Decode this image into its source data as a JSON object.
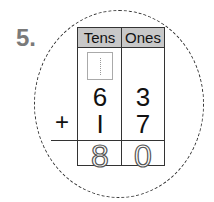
{
  "question": {
    "number": "5."
  },
  "table": {
    "headers": [
      "Tens",
      "Ones"
    ],
    "rows": [
      {
        "tens": "",
        "ones": "",
        "tens_box": true
      },
      {
        "tens": "6",
        "ones": "3"
      },
      {
        "operator": "+",
        "tens": "I",
        "ones": "7"
      }
    ],
    "answer": {
      "tens": "8",
      "ones": "0",
      "style": "dotted-trace"
    }
  }
}
